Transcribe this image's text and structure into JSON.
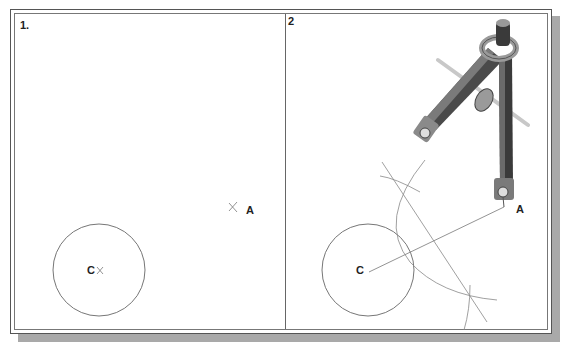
{
  "figure": {
    "panels": [
      {
        "label": "1.",
        "points": {
          "C": "C",
          "A": "A"
        },
        "circle": {
          "cx": 99,
          "cy": 270,
          "r": 46
        },
        "point_a": {
          "x": 233,
          "y": 207
        }
      },
      {
        "label": "2",
        "points": {
          "C": "C",
          "A": "A"
        },
        "circle": {
          "cx": 368,
          "cy": 270,
          "r": 46
        },
        "point_a": {
          "x": 504,
          "y": 207
        }
      }
    ],
    "colors": {
      "line": "#777777",
      "frame": "#555555",
      "shadow": "#a9a9a9",
      "compass_dark": "#3a3a3a",
      "compass_mid": "#8a8a8a",
      "compass_light": "#c8c8c8"
    }
  }
}
